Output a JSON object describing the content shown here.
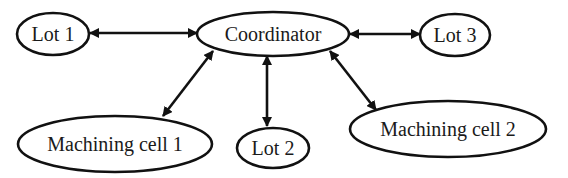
{
  "diagram": {
    "type": "hub-and-spoke",
    "nodes": [
      {
        "id": "lot1",
        "label": "Lot 1",
        "cx": 53,
        "cy": 34,
        "rx": 36,
        "ry": 21
      },
      {
        "id": "coordinator",
        "label": "Coordinator",
        "cx": 273,
        "cy": 34,
        "rx": 76,
        "ry": 22
      },
      {
        "id": "lot3",
        "label": "Lot 3",
        "cx": 455,
        "cy": 35,
        "rx": 35,
        "ry": 21
      },
      {
        "id": "mc1",
        "label": "Machining cell 1",
        "cx": 115,
        "cy": 144,
        "rx": 97,
        "ry": 28
      },
      {
        "id": "lot2",
        "label": "Lot 2",
        "cx": 273,
        "cy": 148,
        "rx": 36,
        "ry": 20
      },
      {
        "id": "mc2",
        "label": "Machining cell 2",
        "cx": 448,
        "cy": 129,
        "rx": 98,
        "ry": 28
      }
    ],
    "edges": [
      {
        "from": "lot1",
        "to": "coordinator",
        "direction": "bidirectional",
        "x1": 90,
        "y1": 33,
        "x2": 197,
        "y2": 33
      },
      {
        "from": "coordinator",
        "to": "lot3",
        "direction": "bidirectional",
        "x1": 350,
        "y1": 34,
        "x2": 420,
        "y2": 34
      },
      {
        "from": "coordinator",
        "to": "mc1",
        "direction": "bidirectional",
        "x1": 213,
        "y1": 51,
        "x2": 163,
        "y2": 116
      },
      {
        "from": "coordinator",
        "to": "lot2",
        "direction": "bidirectional",
        "x1": 267,
        "y1": 56,
        "x2": 267,
        "y2": 126
      },
      {
        "from": "coordinator",
        "to": "mc2",
        "direction": "bidirectional",
        "x1": 330,
        "y1": 51,
        "x2": 376,
        "y2": 110
      }
    ]
  }
}
